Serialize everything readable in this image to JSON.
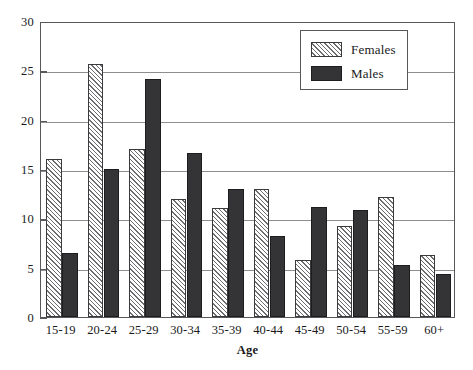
{
  "chart_data": {
    "type": "bar",
    "title": "",
    "xlabel": "Age",
    "ylabel": "",
    "categories": [
      "15-19",
      "20-24",
      "25-29",
      "30-34",
      "35-39",
      "40-44",
      "45-49",
      "50-54",
      "55-59",
      "60+"
    ],
    "series": [
      {
        "name": "Females",
        "values": [
          16.0,
          25.6,
          17.0,
          12.0,
          11.0,
          13.0,
          5.8,
          9.2,
          12.2,
          6.3
        ],
        "pattern": "diagonal-hatch",
        "color": "#ffffff"
      },
      {
        "name": "Males",
        "values": [
          6.5,
          15.0,
          24.1,
          16.6,
          13.0,
          8.2,
          11.2,
          10.8,
          5.3,
          4.4
        ],
        "pattern": "solid",
        "color": "#343436"
      }
    ],
    "ylim": [
      0,
      30
    ],
    "yticks": [
      0,
      5,
      10,
      15,
      20,
      25,
      30
    ],
    "ytick_labels": [
      "0",
      "5",
      "10",
      "15",
      "20",
      "25",
      "30"
    ],
    "grid": true,
    "grid_axis": "y",
    "legend_position": "top-right",
    "legend_entries": [
      "Females",
      "Males"
    ],
    "frame": true
  },
  "legend": {
    "females_label": "Females",
    "males_label": "Males"
  },
  "axes": {
    "x_title": "Age"
  }
}
